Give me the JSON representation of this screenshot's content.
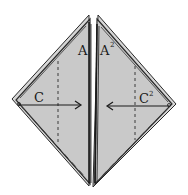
{
  "diagram": {
    "type": "origami-fold-step",
    "colors": {
      "paper": "#c9c9c9",
      "edge": "#2a2a2a",
      "fold_line": "#3a3a3a",
      "background": "#ffffff"
    },
    "labels": {
      "left_center": "A",
      "right_center": "A",
      "right_center_sup": "2",
      "left_corner": "C",
      "right_corner": "C",
      "right_corner_sup": "2"
    },
    "arrows": [
      {
        "name": "fold-left-corner-arrow",
        "from": "C",
        "direction": "right"
      },
      {
        "name": "fold-right-corner-arrow",
        "from": "C2",
        "direction": "left"
      }
    ]
  }
}
